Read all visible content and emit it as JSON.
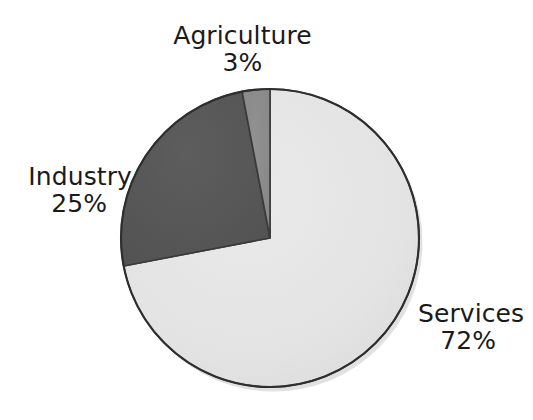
{
  "background_color": "#ffffff",
  "text_color": "#1a1a1a",
  "figure": {
    "name": "economy-sector-pie-chart",
    "geometry": {
      "center_x": 270,
      "center_y": 238,
      "radius": 149,
      "start_angle_deg": 0,
      "direction": "clockwise",
      "outline_color": "#2e2e2e",
      "shadow_color": "#c9c9c9"
    }
  },
  "chart_data": {
    "type": "pie",
    "title": "",
    "subtitle": "",
    "xlabel": "",
    "ylabel": "",
    "legend": "none",
    "grid": false,
    "labels_position": "outside",
    "categories": [
      "Services",
      "Industry",
      "Agriculture"
    ],
    "values": [
      72,
      25,
      3
    ],
    "value_suffix": "%",
    "colors": [
      "#e3e3e3",
      "#575757",
      "#8c8c8c"
    ],
    "slices": [
      {
        "name": "Services",
        "label": "Services",
        "value": 72,
        "value_text": "72%",
        "color": "#e3e3e3",
        "start_angle_deg": 0,
        "end_angle_deg": 259.2
      },
      {
        "name": "Industry",
        "label": "Industry",
        "value": 25,
        "value_text": "25%",
        "color": "#575757",
        "start_angle_deg": 259.2,
        "end_angle_deg": 349.2
      },
      {
        "name": "Agriculture",
        "label": "Agriculture",
        "value": 3,
        "value_text": "3%",
        "color": "#8c8c8c",
        "start_angle_deg": 349.2,
        "end_angle_deg": 360
      }
    ]
  },
  "labels": {
    "agriculture": {
      "name": "Agriculture",
      "value": "3%"
    },
    "industry": {
      "name": "Industry",
      "value": "25%"
    },
    "services": {
      "name": "Services",
      "value": "72%"
    }
  }
}
